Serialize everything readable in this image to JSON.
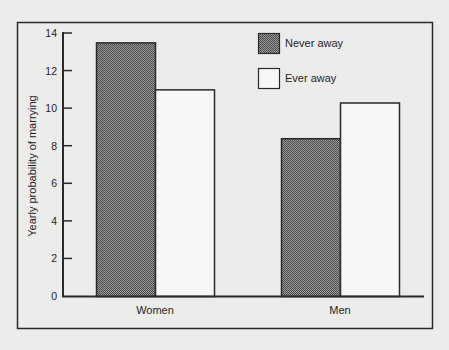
{
  "chart_data": {
    "type": "bar",
    "title": "",
    "xlabel": "",
    "ylabel": "Yearly probability of marrying",
    "categories": [
      "Women",
      "Men"
    ],
    "series": [
      {
        "name": "Never away",
        "values": [
          13.5,
          8.4
        ],
        "fill": "dark-dithered"
      },
      {
        "name": "Ever away",
        "values": [
          11.0,
          10.3
        ],
        "fill": "white"
      }
    ],
    "ylim": [
      0,
      14
    ],
    "yticks": [
      0,
      2,
      4,
      6,
      8,
      10,
      12,
      14
    ],
    "grid": false,
    "legend_position": "top-right inside"
  },
  "legend": {
    "items": [
      {
        "label": "Never away",
        "swatch": "dark-dithered"
      },
      {
        "label": "Ever away",
        "swatch": "white"
      }
    ]
  },
  "axes": {
    "ylabel": "Yearly probability of marrying",
    "yticks": [
      "0",
      "2",
      "4",
      "6",
      "8",
      "10",
      "12",
      "14"
    ],
    "xticks": [
      "Women",
      "Men"
    ]
  },
  "colors": {
    "background": "#ececea",
    "frame": "#2a2a2a",
    "dark_fill": "#6e6e6e",
    "dark_fill_alt": "#b8b8b8",
    "light_fill": "#f7f7f5"
  }
}
